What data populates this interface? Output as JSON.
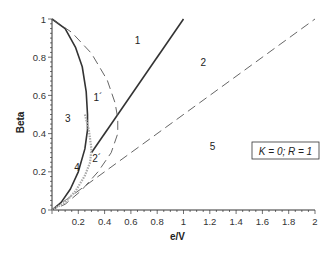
{
  "chart_data": {
    "type": "line",
    "title": "",
    "xlabel": "e/V",
    "ylabel": "Beta",
    "xlim": [
      0,
      2
    ],
    "ylim": [
      0,
      1
    ],
    "grid": false,
    "x_ticks": [
      0.2,
      0.4,
      0.6,
      0.8,
      1,
      1.2,
      1.4,
      1.6,
      1.8,
      2
    ],
    "x_tick_labels": [
      "0.2",
      "0.4",
      "0.6",
      "0.8",
      "1",
      "1.2",
      "1.4",
      "1.6",
      "1.8",
      "2"
    ],
    "y_ticks": [
      0,
      0.2,
      0.4,
      0.6,
      0.8,
      1
    ],
    "y_tick_labels": [
      "0",
      "0.2",
      "0.4",
      "0.6",
      "0.8",
      "1"
    ],
    "annotation_box": "K = 0; R = 1",
    "series": [
      {
        "name": "solid-boundary-curve",
        "style": "solid",
        "color": "#333333",
        "x": [
          0,
          0.1,
          0.18,
          0.23,
          0.26,
          0.27,
          0.27,
          0.25,
          0.2,
          0.14,
          0.07,
          0
        ],
        "y": [
          1,
          0.95,
          0.85,
          0.75,
          0.62,
          0.5,
          0.42,
          0.32,
          0.2,
          0.11,
          0.04,
          0
        ]
      },
      {
        "name": "solid-line-beta-equals-e-over-v",
        "style": "solid",
        "color": "#333333",
        "x": [
          0.3,
          1
        ],
        "y": [
          0.3,
          1
        ]
      },
      {
        "name": "dashed-outer-curve",
        "style": "dashed",
        "color": "#555555",
        "x": [
          0,
          0.15,
          0.3,
          0.42,
          0.48,
          0.5,
          0.5,
          0.45,
          0.35,
          0.22,
          0.1,
          0
        ],
        "y": [
          1,
          0.93,
          0.82,
          0.68,
          0.56,
          0.48,
          0.4,
          0.3,
          0.2,
          0.1,
          0.03,
          0
        ]
      },
      {
        "name": "dashed-line-beta-equals-half-e-over-v",
        "style": "dashed",
        "color": "#555555",
        "x": [
          0,
          2
        ],
        "y": [
          0,
          1
        ]
      },
      {
        "name": "dotted-gray-curve",
        "style": "dotted",
        "color": "#aaaaaa",
        "x": [
          0.25,
          0.28,
          0.3,
          0.29,
          0.25,
          0.18,
          0.1,
          0
        ],
        "y": [
          0.5,
          0.42,
          0.32,
          0.25,
          0.18,
          0.1,
          0.04,
          0
        ]
      }
    ],
    "region_labels": [
      {
        "text": "1",
        "x": 0.65,
        "y": 0.89
      },
      {
        "text": "2",
        "x": 1.15,
        "y": 0.77
      },
      {
        "text": "1´",
        "x": 0.35,
        "y": 0.59
      },
      {
        "text": "3",
        "x": 0.12,
        "y": 0.48
      },
      {
        "text": "2´",
        "x": 0.34,
        "y": 0.27
      },
      {
        "text": "4",
        "x": 0.19,
        "y": 0.22
      },
      {
        "text": "5",
        "x": 1.22,
        "y": 0.33
      }
    ]
  }
}
